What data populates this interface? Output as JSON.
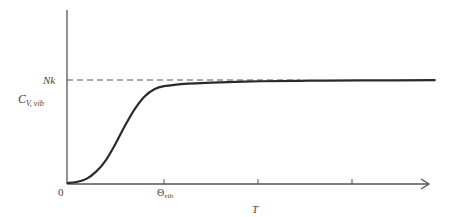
{
  "chart_data": {
    "type": "line",
    "title": "",
    "xlabel": "T",
    "ylabel": "C_V, vib",
    "ylabel_main": "C",
    "ylabel_sub": "V, vib",
    "origin_label": "0",
    "x_ticks": [
      {
        "label": "Θ",
        "label_sub": "vib",
        "x": 1
      },
      {
        "label": "",
        "x": 2
      },
      {
        "label": "",
        "x": 3
      }
    ],
    "asymptote": {
      "label": "Nk",
      "value": 1.0,
      "style": "dashed"
    },
    "series": [
      {
        "name": "C_V,vib vs T",
        "x": [
          0,
          0.1,
          0.2,
          0.3,
          0.4,
          0.5,
          0.6,
          0.7,
          0.8,
          0.9,
          1.0,
          1.25,
          1.5,
          2.0,
          2.5,
          3.0,
          3.8
        ],
        "values": [
          0.0,
          0.01,
          0.04,
          0.11,
          0.22,
          0.38,
          0.56,
          0.72,
          0.84,
          0.91,
          0.94,
          0.965,
          0.975,
          0.988,
          0.993,
          0.996,
          0.998
        ]
      }
    ],
    "xlim": [
      0,
      3.9
    ],
    "ylim": [
      0,
      1.35
    ],
    "grid": false,
    "legend": "none"
  }
}
